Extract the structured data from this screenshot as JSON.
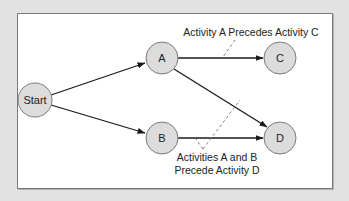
{
  "diagram": {
    "type": "precedence-network",
    "colors": {
      "background": "#e2e2e2",
      "panel": "#ffffff",
      "panel_border": "#7a7a7a",
      "node_fill": "#dcdcdc",
      "node_stroke": "#7a7a7a",
      "edge": "#1a1a1a",
      "annotation_line": "#777777"
    },
    "nodes": [
      {
        "id": "start",
        "label": "Start",
        "cx": 35,
        "cy": 100,
        "r": 17
      },
      {
        "id": "a",
        "label": "A",
        "cx": 162,
        "cy": 58,
        "r": 16
      },
      {
        "id": "b",
        "label": "B",
        "cx": 162,
        "cy": 138,
        "r": 16
      },
      {
        "id": "c",
        "label": "C",
        "cx": 280,
        "cy": 58,
        "r": 16
      },
      {
        "id": "d",
        "label": "D",
        "cx": 280,
        "cy": 138,
        "r": 16
      }
    ],
    "edges": [
      {
        "from": "start",
        "to": "a"
      },
      {
        "from": "start",
        "to": "b"
      },
      {
        "from": "a",
        "to": "c"
      },
      {
        "from": "a",
        "to": "d"
      },
      {
        "from": "b",
        "to": "d"
      }
    ],
    "annotations": {
      "a_precedes_c": {
        "text": "Activity A Precedes Activity C"
      },
      "ab_precede_d": {
        "line1": "Activities A and B",
        "line2": "Precede Activity D"
      }
    }
  }
}
